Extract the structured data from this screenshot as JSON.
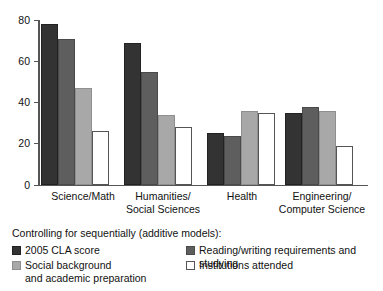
{
  "chart_data": {
    "type": "bar",
    "title": "",
    "subtitle": "",
    "xlabel": "",
    "ylabel": "",
    "ylim": [
      0,
      80
    ],
    "yticks": [
      0,
      20,
      40,
      60,
      80
    ],
    "ytick_labels": [
      "0",
      "20",
      "40",
      "60",
      "80"
    ],
    "grid": false,
    "legend_position": "bottom",
    "legend_title": "Controlling for sequentially (additive models):",
    "categories": [
      "Science/Math",
      "Humanities/\nSocial Sciences",
      "Health",
      "Engineering/\nComputer Science"
    ],
    "series": [
      {
        "name": "2005 CLA score",
        "color": "#333333",
        "border": "#222222",
        "values": [
          78,
          69,
          25,
          35
        ]
      },
      {
        "name": "Reading/writing requirements and studying",
        "color": "#5e5e5e",
        "border": "#4a4a4a",
        "values": [
          71,
          55,
          24,
          38
        ]
      },
      {
        "name": "Social background\nand academic preparation",
        "color": "#a8a8a8",
        "border": "#8f8f8f",
        "values": [
          47,
          34,
          36,
          36
        ]
      },
      {
        "name": "Institutions attended",
        "color": "#ffffff",
        "border": "#555555",
        "values": [
          26,
          28,
          35,
          19
        ]
      }
    ]
  },
  "axis": {
    "tick_80": "80",
    "tick_60": "60",
    "tick_40": "40",
    "tick_20": "20",
    "tick_0": "0"
  },
  "groups": {
    "g0_line1": "Science/Math",
    "g0_line2": "",
    "g1_line1": "Humanities/",
    "g1_line2": "Social Sciences",
    "g2_line1": "Health",
    "g2_line2": "",
    "g3_line1": "Engineering/",
    "g3_line2": "Computer Science"
  },
  "legend": {
    "title": "Controlling for sequentially (additive models):",
    "item1": "2005 CLA score",
    "item2": "Social background\nand academic preparation",
    "item3": "Reading/writing requirements and studying",
    "item4": "Institutions attended"
  }
}
